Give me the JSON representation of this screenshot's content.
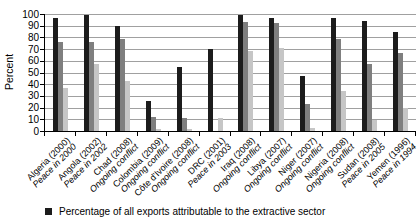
{
  "chart_data": {
    "type": "bar",
    "title": "",
    "xlabel": "",
    "ylabel": "Percent",
    "ylim": [
      0,
      100
    ],
    "ytick_step": 10,
    "grid": true,
    "legend_position": "bottom",
    "categories": [
      "Algeria (2000)",
      "Angola (2002)",
      "Chad (2008)",
      "Colombia (2009)",
      "Côte d'Ivoire (2008)",
      "DRC (2001)",
      "Iraq (2008)",
      "Libya (2007)",
      "Niger (2007)",
      "Nigeria (2008)",
      "Sudan (2008)",
      "Yemen (1996)"
    ],
    "category_sublabels": [
      "Peace in 2000",
      "Peace in 2002",
      "Ongoing conflict",
      "Ongoing conflict",
      "Ongoing conflict",
      "Peace in 2003",
      "Ongoing conflict",
      "Ongoing conflict",
      "Ongoing conflict",
      "Ongoing conflict",
      "Peace in 2005",
      "Peace in 1994"
    ],
    "series": [
      {
        "name": "Percentage of all exports attributable to the extractive sector",
        "color": "#1c1c1c",
        "values": [
          97,
          99,
          90,
          26,
          55,
          70,
          99,
          97,
          47,
          97,
          94,
          85
        ]
      },
      {
        "name": "",
        "color": "#7f7f7f",
        "values": [
          76,
          76,
          79,
          12,
          11,
          0,
          93,
          92,
          23,
          79,
          57,
          67
        ]
      },
      {
        "name": "",
        "color": "#c6c6c6",
        "values": [
          37,
          57,
          43,
          2,
          2,
          11,
          68,
          71,
          3,
          34,
          9,
          20
        ]
      }
    ]
  },
  "legend": {
    "items": [
      {
        "label": "Percentage of all exports attributable to the extractive sector",
        "color": "#1c1c1c"
      }
    ]
  },
  "colors": {
    "axis": "#000000",
    "gridline": "#a0a0a0",
    "background": "#ffffff",
    "text": "#000000"
  }
}
